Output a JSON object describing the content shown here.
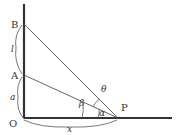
{
  "diagram": {
    "points": {
      "B": {
        "label": "B",
        "x": 24,
        "y": 24
      },
      "A": {
        "label": "A",
        "x": 24,
        "y": 75
      },
      "O": {
        "label": "O",
        "x": 24,
        "y": 118
      },
      "P": {
        "label": "P",
        "x": 118,
        "y": 118
      }
    },
    "lengths": {
      "l": "l",
      "a": "a",
      "x": "x"
    },
    "angles": {
      "theta": "θ",
      "beta": "β",
      "alpha": "α"
    },
    "colors": {
      "line": "#333333",
      "thin": "#555555"
    }
  }
}
